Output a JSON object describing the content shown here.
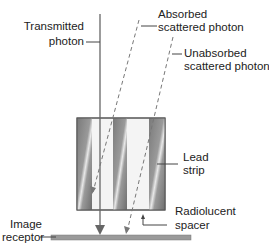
{
  "diagram": {
    "labels": {
      "transmitted": [
        "Transmitted",
        "photon"
      ],
      "absorbed": [
        "Absorbed",
        "scattered photon"
      ],
      "unabsorbed": [
        "Unabsorbed",
        "scattered photon"
      ],
      "lead_strip": [
        "Lead",
        "strip"
      ],
      "spacer": [
        "Radiolucent",
        "spacer"
      ],
      "receptor": [
        "Image",
        "receptor"
      ]
    },
    "colors": {
      "lead": "#8a8a8a",
      "lead_highlight": "#e6e6e6",
      "spacer": "#f4f4f4",
      "line": "#555555",
      "dashed": "#777777",
      "receptor": "#9a9a9a"
    }
  }
}
